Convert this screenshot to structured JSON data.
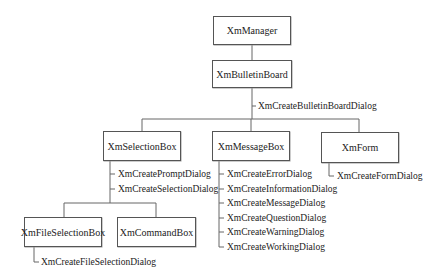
{
  "diagram": {
    "nodes": {
      "manager": "XmManager",
      "bulletin": "XmBulletinBoard",
      "selection": "XmSelectionBox",
      "message": "XmMessageBox",
      "form": "XmForm",
      "fileselection": "XmFileSelectionBox",
      "command": "XmCommandBox"
    },
    "functions": {
      "bulletin": [
        "XmCreateBulletinBoardDialog"
      ],
      "selection": [
        "XmCreatePromptDialog",
        "XmCreateSelectionDialog"
      ],
      "message": [
        "XmCreateErrorDialog",
        "XmCreateInformationDialog",
        "XmCreateMessageDialog",
        "XmCreateQuestionDialog",
        "XmCreateWarningDialog",
        "XmCreateWorkingDialog"
      ],
      "form": [
        "XmCreateFormDialog"
      ],
      "fileselection": [
        "XmCreateFileSelectionDialog"
      ]
    },
    "edges": [
      [
        "manager",
        "bulletin"
      ],
      [
        "bulletin",
        "selection"
      ],
      [
        "bulletin",
        "message"
      ],
      [
        "bulletin",
        "form"
      ],
      [
        "selection",
        "fileselection"
      ],
      [
        "selection",
        "command"
      ]
    ]
  }
}
